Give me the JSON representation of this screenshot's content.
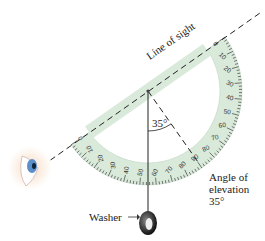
{
  "labels": {
    "line_of_sight": "Line of sight",
    "angle_inner": "35°",
    "angle_of_elevation_1": "Angle of",
    "angle_of_elevation_2": "elevation",
    "angle_of_elevation_3": "35°",
    "washer": "Washer"
  },
  "protractor": {
    "ticks": [
      "0",
      "10",
      "20",
      "30",
      "40",
      "50",
      "60",
      "70",
      "80",
      "90",
      "80",
      "70",
      "60",
      "50",
      "40",
      "30",
      "20",
      "10",
      "0"
    ],
    "fill_color": "#d9eadb"
  },
  "angle_degrees": 35
}
